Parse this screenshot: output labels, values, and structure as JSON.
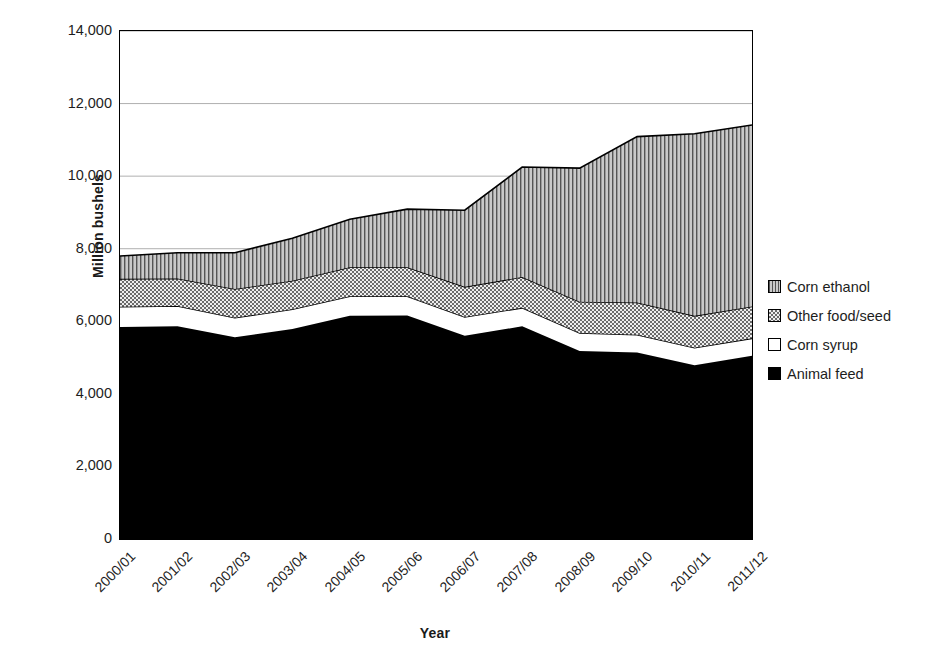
{
  "chart_data": {
    "type": "area",
    "stacked": true,
    "title": "",
    "xlabel": "Year",
    "ylabel": "Million bushels",
    "categories": [
      "2000/01",
      "2001/02",
      "2002/03",
      "2003/04",
      "2004/05",
      "2005/06",
      "2006/07",
      "2007/08",
      "2008/09",
      "2009/10",
      "2010/11",
      "2011/12"
    ],
    "ylim": [
      0,
      14000
    ],
    "ytick_step": 2000,
    "yticks": [
      "0",
      "2,000",
      "4,000",
      "6,000",
      "8,000",
      "10,000",
      "12,000",
      "14,000"
    ],
    "grid": "horizontal",
    "legend_position": "right",
    "series": [
      {
        "name": "Corn ethanol",
        "pattern": "vertical-lines",
        "fill": "#b4b4b4",
        "values": [
          630,
          710,
          1000,
          1170,
          1320,
          1600,
          2110,
          3030,
          3680,
          4570,
          5020,
          5000
        ]
      },
      {
        "name": "Other food/seed",
        "pattern": "crosshatch-dots",
        "fill": "#d8d8d8",
        "values": [
          770,
          760,
          790,
          790,
          800,
          800,
          830,
          850,
          860,
          890,
          880,
          880
        ]
      },
      {
        "name": "Corn syrup",
        "pattern": "solid-white",
        "fill": "#ffffff",
        "values": [
          560,
          560,
          540,
          540,
          540,
          530,
          520,
          510,
          500,
          490,
          480,
          480
        ]
      },
      {
        "name": "Animal feed",
        "pattern": "solid-black",
        "fill": "#000000",
        "values": [
          5840,
          5860,
          5560,
          5790,
          6150,
          6160,
          5600,
          5860,
          5180,
          5140,
          4790,
          5050
        ]
      }
    ],
    "series_order_bottom_to_top": [
      "Animal feed",
      "Corn syrup",
      "Other food/seed",
      "Corn ethanol"
    ],
    "stack_totals": [
      7800,
      7890,
      7890,
      8290,
      8810,
      9090,
      9060,
      10250,
      10220,
      11090,
      11170,
      11410
    ]
  },
  "legend": {
    "items": [
      {
        "label": "Corn ethanol"
      },
      {
        "label": "Other food/seed"
      },
      {
        "label": "Corn syrup"
      },
      {
        "label": "Animal feed"
      }
    ]
  }
}
